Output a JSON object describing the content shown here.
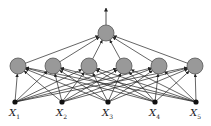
{
  "diagram": {
    "type": "neural-network",
    "inputs": [
      {
        "name": "X",
        "sub": "1",
        "x": 15,
        "y": 102
      },
      {
        "name": "X",
        "sub": "2",
        "x": 62,
        "y": 102
      },
      {
        "name": "X",
        "sub": "3",
        "x": 108,
        "y": 102
      },
      {
        "name": "X",
        "sub": "4",
        "x": 155,
        "y": 102
      },
      {
        "name": "X",
        "sub": "5",
        "x": 196,
        "y": 102
      }
    ],
    "hidden": [
      {
        "x": 18,
        "y": 66
      },
      {
        "x": 53,
        "y": 66
      },
      {
        "x": 89,
        "y": 66
      },
      {
        "x": 124,
        "y": 66
      },
      {
        "x": 159,
        "y": 66
      },
      {
        "x": 195,
        "y": 66
      }
    ],
    "output": {
      "x": 106,
      "y": 33
    },
    "colors": {
      "node_fill": "#999999",
      "node_stroke": "#555555",
      "edge": "#222222"
    }
  }
}
